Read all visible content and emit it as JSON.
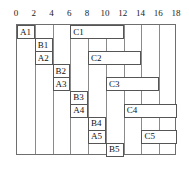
{
  "chart_data": {
    "type": "bar",
    "title": "",
    "subtitle": "",
    "xlabel": "",
    "ylabel": "",
    "orientation": "horizontal",
    "grid": true,
    "legend": null,
    "xlim": [
      0,
      18
    ],
    "xticks": [
      0,
      2,
      4,
      6,
      8,
      10,
      12,
      14,
      16,
      18
    ],
    "xtick_labels": [
      "0",
      "2",
      "4",
      "6",
      "8",
      "10",
      "12",
      "14",
      "16",
      "18"
    ],
    "rows": 10,
    "row_labels": [
      "A1",
      "B1",
      "A2",
      "B2",
      "A3",
      "B3",
      "A4",
      "B4",
      "A5",
      "B5"
    ],
    "bars": [
      {
        "label": "A1",
        "row": 0,
        "start": 0,
        "end": 2
      },
      {
        "label": "C1",
        "row": 0,
        "start": 6,
        "end": 12
      },
      {
        "label": "B1",
        "row": 1,
        "start": 2,
        "end": 4
      },
      {
        "label": "A2",
        "row": 2,
        "start": 2,
        "end": 4
      },
      {
        "label": "C2",
        "row": 2,
        "start": 8,
        "end": 14
      },
      {
        "label": "B2",
        "row": 3,
        "start": 4,
        "end": 6
      },
      {
        "label": "A3",
        "row": 4,
        "start": 4,
        "end": 6
      },
      {
        "label": "C3",
        "row": 4,
        "start": 10,
        "end": 16
      },
      {
        "label": "B3",
        "row": 5,
        "start": 6,
        "end": 8
      },
      {
        "label": "A4",
        "row": 6,
        "start": 6,
        "end": 8
      },
      {
        "label": "C4",
        "row": 6,
        "start": 12,
        "end": 18
      },
      {
        "label": "B4",
        "row": 7,
        "start": 8,
        "end": 10
      },
      {
        "label": "A5",
        "row": 8,
        "start": 8,
        "end": 10
      },
      {
        "label": "C5",
        "row": 8,
        "start": 14,
        "end": 18
      },
      {
        "label": "B5",
        "row": 9,
        "start": 10,
        "end": 12
      }
    ],
    "colors": {
      "bar_fill": "#ffffff",
      "bar_border": "#555555",
      "grid": "#8a8a8a",
      "frame": "#6e6e6e",
      "text": "#111111",
      "background": "#ffffff"
    }
  }
}
